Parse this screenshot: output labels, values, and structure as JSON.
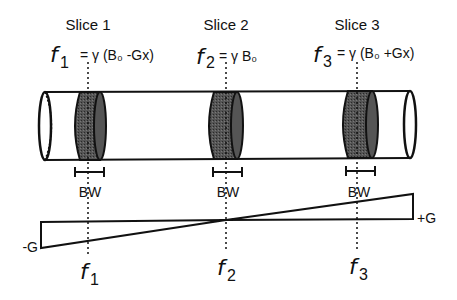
{
  "diagram": {
    "slices": [
      {
        "name": "Slice 1",
        "freq_symbol": "f",
        "freq_sub": "1",
        "equation": "= γ (B₀ -Gx)",
        "bandwidth_label": "BW",
        "bottom_symbol": "f",
        "bottom_sub": "1"
      },
      {
        "name": "Slice 2",
        "freq_symbol": "f",
        "freq_sub": "2",
        "equation": "= γ B₀",
        "bandwidth_label": "BW",
        "bottom_symbol": "f",
        "bottom_sub": "2"
      },
      {
        "name": "Slice 3",
        "freq_symbol": "f",
        "freq_sub": "3",
        "equation": "= γ (B₀ +Gx)",
        "bandwidth_label": "BW",
        "bottom_symbol": "f",
        "bottom_sub": "3"
      }
    ],
    "gradient": {
      "negative_label": "-G",
      "positive_label": "+G"
    },
    "colors": {
      "line": "#111111",
      "slice_fill": "#4a4a4a",
      "background": "#ffffff"
    }
  }
}
